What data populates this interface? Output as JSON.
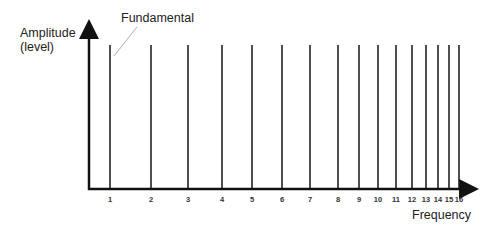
{
  "chart_data": {
    "type": "bar",
    "title": "",
    "xlabel": "Frequency",
    "ylabel": "Amplitude (level)",
    "ylabel_lines": [
      "Amplitude",
      "(level)"
    ],
    "annotation": "Fundamental",
    "categories": [
      "1",
      "2",
      "3",
      "4",
      "5",
      "6",
      "7",
      "8",
      "9",
      "10",
      "11",
      "12",
      "13",
      "14",
      "15",
      "16"
    ],
    "values": [
      1,
      1,
      1,
      1,
      1,
      1,
      1,
      1,
      1,
      1,
      1,
      1,
      1,
      1,
      1,
      1
    ],
    "x_positions_px": [
      110,
      151,
      188,
      222,
      252,
      282,
      310,
      338,
      359,
      378,
      396,
      412,
      426,
      438,
      449,
      459
    ],
    "grid": false,
    "legend": "none"
  },
  "colors": {
    "line": "#222222",
    "leader": "#999999"
  }
}
